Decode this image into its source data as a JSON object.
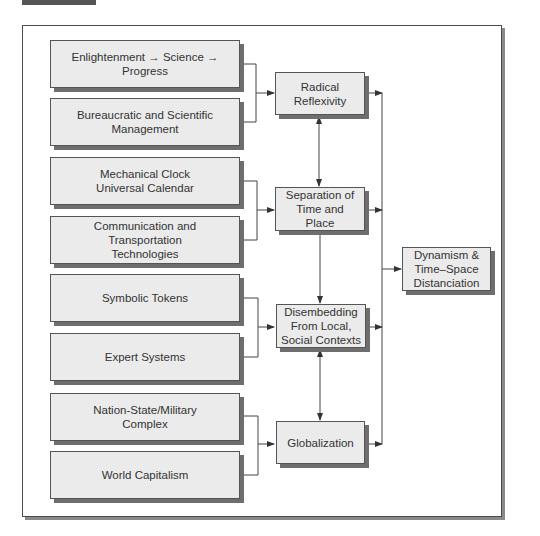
{
  "figure": {
    "sources": [
      {
        "id": "enlightenment",
        "label": "Enlightenment → Science → Progress"
      },
      {
        "id": "bureaucratic",
        "label": "Bureaucratic and Scientific\nManagement"
      },
      {
        "id": "clock",
        "label": "Mechanical Clock\nUniversal Calendar"
      },
      {
        "id": "communication",
        "label": "Communication and\nTransportation\nTechnologies"
      },
      {
        "id": "tokens",
        "label": "Symbolic Tokens"
      },
      {
        "id": "expert",
        "label": "Expert Systems"
      },
      {
        "id": "nation",
        "label": "Nation-State/Military\nComplex"
      },
      {
        "id": "capitalism",
        "label": "World Capitalism"
      }
    ],
    "processes": [
      {
        "id": "reflexivity",
        "label": "Radical\nReflexivity"
      },
      {
        "id": "separation",
        "label": "Separation of\nTime and\nPlace"
      },
      {
        "id": "disembedding",
        "label": "Disembedding\nFrom Local,\nSocial Contexts"
      },
      {
        "id": "globalization",
        "label": "Globalization"
      }
    ],
    "outcome": {
      "id": "dynamism",
      "label": "Dynamism &\nTime–Space\nDistanciation"
    },
    "edges": [
      {
        "from": [
          "enlightenment",
          "bureaucratic"
        ],
        "to": "reflexivity"
      },
      {
        "from": [
          "clock",
          "communication"
        ],
        "to": "separation"
      },
      {
        "from": [
          "tokens",
          "expert"
        ],
        "to": "disembedding"
      },
      {
        "from": [
          "nation",
          "capitalism"
        ],
        "to": "globalization"
      },
      {
        "from": "reflexivity",
        "to": "separation",
        "bidirectional": true
      },
      {
        "from": "separation",
        "to": "disembedding",
        "bidirectional": false
      },
      {
        "from": "disembedding",
        "to": "globalization",
        "bidirectional": true
      },
      {
        "from": [
          "reflexivity",
          "separation",
          "disembedding",
          "globalization"
        ],
        "to": "dynamism"
      }
    ]
  }
}
